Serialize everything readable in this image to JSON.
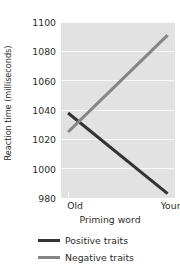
{
  "chart_data": {
    "type": "line",
    "title": "",
    "subtitle": "",
    "xlabel": "Priming word",
    "ylabel": "Reaction time (milliseconds)",
    "categories": [
      "Old",
      "Young"
    ],
    "x": [
      0,
      1
    ],
    "series": [
      {
        "name": "Positive traits",
        "values": [
          1038,
          983
        ],
        "color": "#333333"
      },
      {
        "name": "Negative traits",
        "values": [
          1025,
          1091
        ],
        "color": "#858585"
      }
    ],
    "ylim": [
      980,
      1100
    ],
    "yticks": [
      980,
      1000,
      1020,
      1040,
      1060,
      1080,
      1100
    ],
    "ytick_labels": [
      "980",
      "1000",
      "1020",
      "1040",
      "1060",
      "1080",
      "1100"
    ],
    "xtick_labels": [
      "Old",
      "Young"
    ],
    "grid": true,
    "grid_axis": "y",
    "grid_color": "#fafafa",
    "panel_background": "#e2e2e2",
    "legend_position": "bottom",
    "legend": [
      {
        "label": "Positive traits",
        "color": "#333333"
      },
      {
        "label": "Negative traits",
        "color": "#858585"
      }
    ]
  }
}
